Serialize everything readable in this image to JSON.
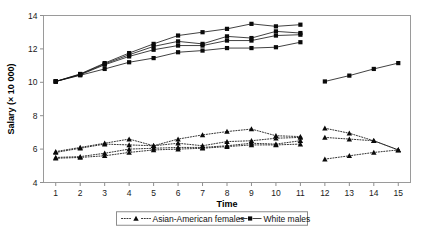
{
  "chart_data": {
    "type": "line",
    "title": "",
    "xlabel": "Time",
    "ylabel": "Salary (× 10 000)",
    "xlim": [
      0.5,
      15.5
    ],
    "ylim": [
      4,
      14
    ],
    "xticks": [
      1,
      2,
      3,
      4,
      5,
      6,
      7,
      8,
      9,
      10,
      11,
      12,
      13,
      14,
      15
    ],
    "yticks": [
      4,
      6,
      8,
      10,
      12,
      14
    ],
    "grid": false,
    "legend_position": "bottom-center",
    "legend": [
      {
        "label": "Asian-American females",
        "marker": "triangle",
        "line": "dotted"
      },
      {
        "label": "White males",
        "marker": "square",
        "line": "solid"
      }
    ],
    "series": [
      {
        "name": "White males 1",
        "group": "White males",
        "marker": "square",
        "line": "solid",
        "x": [
          1,
          2,
          3,
          4,
          5,
          6,
          7,
          8,
          9,
          10,
          11
        ],
        "values": [
          10.05,
          10.5,
          11.15,
          11.75,
          12.3,
          12.8,
          13.0,
          13.2,
          13.5,
          13.35,
          13.45
        ]
      },
      {
        "name": "White males 2",
        "group": "White males",
        "marker": "square",
        "line": "solid",
        "x": [
          1,
          2,
          3,
          4,
          5,
          6,
          7,
          8,
          9,
          10,
          11
        ],
        "values": [
          10.05,
          10.48,
          11.1,
          11.65,
          12.15,
          12.45,
          12.3,
          12.75,
          12.65,
          13.05,
          12.95
        ]
      },
      {
        "name": "White males 3",
        "group": "White males",
        "marker": "square",
        "line": "solid",
        "x": [
          1,
          2,
          3,
          4,
          5,
          6,
          7,
          8,
          9,
          10,
          11
        ],
        "values": [
          10.05,
          10.45,
          11.05,
          11.55,
          11.95,
          12.2,
          12.2,
          12.5,
          12.5,
          12.8,
          12.85
        ]
      },
      {
        "name": "White males 4",
        "group": "White males",
        "marker": "square",
        "line": "solid",
        "x": [
          1,
          2,
          3,
          4,
          5,
          6,
          7,
          8,
          9,
          10,
          11
        ],
        "values": [
          10.05,
          10.42,
          10.8,
          11.2,
          11.45,
          11.8,
          11.9,
          12.05,
          12.05,
          12.1,
          12.4
        ]
      },
      {
        "name": "White males 5",
        "group": "White males",
        "marker": "square",
        "line": "solid",
        "x": [
          12,
          13,
          14,
          15
        ],
        "values": [
          10.05,
          10.4,
          10.8,
          11.15
        ]
      },
      {
        "name": "Asian-American females 1",
        "group": "Asian-American females",
        "marker": "triangle",
        "line": "dotted",
        "x": [
          1,
          2,
          3,
          4,
          5,
          6,
          7,
          8,
          9,
          10,
          11
        ],
        "values": [
          5.85,
          6.1,
          6.35,
          6.6,
          6.2,
          6.6,
          6.85,
          7.05,
          7.2,
          6.8,
          6.75
        ]
      },
      {
        "name": "Asian-American females 2",
        "group": "Asian-American females",
        "marker": "triangle",
        "line": "dotted",
        "x": [
          1,
          2,
          3,
          4,
          5,
          6,
          7,
          8,
          9,
          10,
          11
        ],
        "values": [
          5.8,
          6.05,
          6.3,
          6.25,
          6.2,
          6.35,
          6.2,
          6.45,
          6.5,
          6.65,
          6.7
        ]
      },
      {
        "name": "Asian-American females 3",
        "group": "Asian-American females",
        "marker": "triangle",
        "line": "dotted",
        "x": [
          1,
          2,
          3,
          4,
          5,
          6,
          7,
          8,
          9,
          10,
          11
        ],
        "values": [
          5.5,
          5.55,
          5.75,
          6.0,
          6.05,
          6.1,
          6.1,
          6.2,
          6.35,
          6.3,
          6.5
        ]
      },
      {
        "name": "Asian-American females 4",
        "group": "Asian-American females",
        "marker": "triangle",
        "line": "dotted",
        "x": [
          1,
          2,
          3,
          4,
          5,
          6,
          7,
          8,
          9,
          10,
          11
        ],
        "values": [
          5.45,
          5.5,
          5.6,
          5.8,
          5.95,
          6.0,
          6.05,
          6.15,
          6.25,
          6.25,
          6.3
        ]
      },
      {
        "name": "Asian-American females 5",
        "group": "Asian-American females",
        "marker": "triangle",
        "line": "dotted",
        "x": [
          12,
          13,
          14,
          15
        ],
        "values": [
          7.25,
          6.95,
          6.5,
          5.95
        ]
      },
      {
        "name": "Asian-American females 6",
        "group": "Asian-American females",
        "marker": "triangle",
        "line": "dotted",
        "x": [
          12,
          13,
          14,
          15
        ],
        "values": [
          6.7,
          6.6,
          6.5,
          5.95
        ]
      },
      {
        "name": "Asian-American females 7",
        "group": "Asian-American females",
        "marker": "triangle",
        "line": "dotted",
        "x": [
          12,
          13,
          14,
          15
        ],
        "values": [
          5.4,
          5.6,
          5.8,
          5.95
        ]
      }
    ]
  }
}
